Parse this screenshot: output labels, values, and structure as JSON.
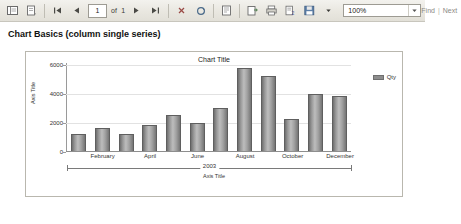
{
  "toolbar": {
    "icons": [
      {
        "name": "document-map-icon",
        "glyph": "▤"
      },
      {
        "name": "page-setup-icon",
        "glyph": "⿴"
      }
    ],
    "nav": {
      "first_icon": "first-page-icon",
      "prev_icon": "previous-page-icon",
      "current_page": "1",
      "of_label": "of",
      "total_pages": "1",
      "next_icon": "next-page-icon",
      "last_icon": "last-page-icon"
    },
    "stop_icon": "stop-icon",
    "refresh_icon": "refresh-icon",
    "print_icon": "print-icon",
    "print_layout_icon": "print-layout-icon",
    "page_setup_icon": "page-setup-icon",
    "export_icon": "export-icon",
    "save_icon": "save-export-icon",
    "save_dropdown_icon": "chevron-down-icon",
    "zoom": {
      "value": "100%",
      "dropdown_icon": "chevron-down-icon"
    },
    "find": {
      "find_label": "Find",
      "separator": "|",
      "next_label": "Next"
    }
  },
  "report": {
    "title": "Chart Basics (column single series)"
  },
  "chart_data": {
    "type": "bar",
    "title": "Chart Title",
    "xlabel": "Axis Title",
    "ylabel": "Axis Title",
    "group_label": "2003",
    "legend": [
      {
        "name": "Qty",
        "color": "#8d8d8d"
      }
    ],
    "legend_position": "right",
    "grid": true,
    "ylim": [
      0,
      6000
    ],
    "yticks": [
      0,
      2000,
      4000,
      6000
    ],
    "ytick_labels": [
      "0",
      "2000",
      "4000",
      "6000"
    ],
    "categories": [
      "January",
      "February",
      "March",
      "April",
      "May",
      "June",
      "July",
      "August",
      "September",
      "October",
      "November",
      "December"
    ],
    "visible_tick_labels": [
      "February",
      "April",
      "June",
      "August",
      "October",
      "December"
    ],
    "series": [
      {
        "name": "Qty",
        "values": [
          1150,
          1600,
          1150,
          1800,
          2500,
          1950,
          2950,
          5700,
          5150,
          2200,
          3900,
          3800
        ]
      }
    ]
  }
}
